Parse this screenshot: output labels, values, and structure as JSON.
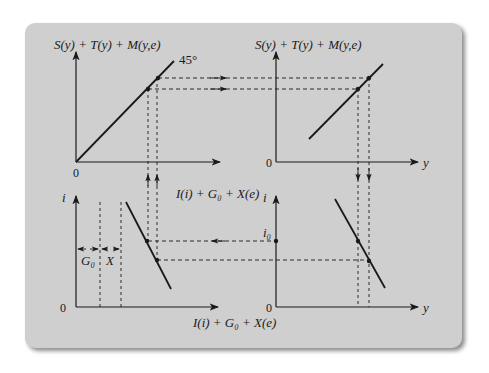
{
  "diagram": {
    "colors": {
      "panel": "#cfcfcf",
      "ink": "#1a1a1a",
      "background": "#ffffff"
    },
    "top_left": {
      "y_axis_label": "S(y) + T(y) + M(y,e)",
      "origin_label": "0",
      "line_label": "45°"
    },
    "top_right": {
      "y_axis_label": "S(y) + T(y) + M(y,e)",
      "origin_label": "0",
      "x_axis_label": "y"
    },
    "bottom_left": {
      "y_axis_label": "i",
      "origin_label": "0",
      "x_axis_label": "I(i) + G₀ + X(e)",
      "curve_label": "I(i) + G₀ + X(e)",
      "segment_labels": [
        "G₀",
        "X"
      ]
    },
    "bottom_right": {
      "y_axis_label": "i",
      "origin_label": "0",
      "x_axis_label": "y",
      "marked_value": "i₀"
    }
  }
}
